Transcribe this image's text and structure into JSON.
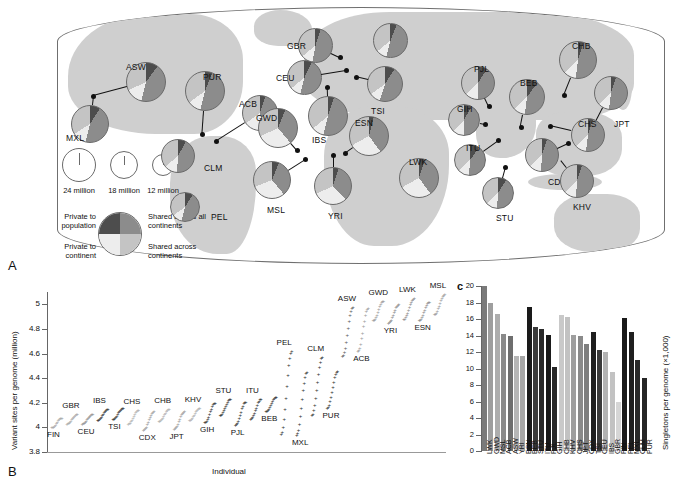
{
  "figure": {
    "panel_a_letter": "A",
    "panel_b_letter": "B",
    "panel_c_letter": "c"
  },
  "map": {
    "size_legend": {
      "items": [
        {
          "label": "24 million",
          "diameter_px": 34
        },
        {
          "label": "18 million",
          "diameter_px": 28
        },
        {
          "label": "12 million",
          "diameter_px": 22
        }
      ]
    },
    "category_legend": {
      "top_left": "Private to population",
      "top_right": "Shared across all continents",
      "bottom_left": "Private to continent",
      "bottom_right": "Shared across continents",
      "colors": {
        "private_to_population": "#4d4d4d",
        "shared_all_continents": "#8c8c8c",
        "private_to_continent": "#ededed",
        "shared_across_continents": "#c4c4c4"
      }
    },
    "populations": [
      {
        "code": "ASW",
        "x": 146,
        "y": 82,
        "d": 40,
        "label_x": 126,
        "label_y": 62,
        "dot_x": 93,
        "dot_y": 96,
        "slices": [
          10,
          44,
          14,
          32
        ]
      },
      {
        "code": "MXL",
        "x": 90,
        "y": 124,
        "d": 38,
        "label_x": 66,
        "label_y": 133,
        "dot_x": 93,
        "dot_y": 96,
        "slices": [
          9,
          45,
          12,
          34
        ]
      },
      {
        "code": "PUR",
        "x": 205,
        "y": 91,
        "d": 40,
        "label_x": 203,
        "label_y": 72,
        "dot_x": 202,
        "dot_y": 134,
        "slices": [
          6,
          48,
          11,
          35
        ]
      },
      {
        "code": "ACB",
        "x": 260,
        "y": 113,
        "d": 36,
        "label_x": 239,
        "label_y": 99,
        "dot_x": 216,
        "dot_y": 141,
        "slices": [
          5,
          41,
          19,
          35
        ]
      },
      {
        "code": "CLM",
        "x": 178,
        "y": 156,
        "d": 34,
        "label_x": 204,
        "label_y": 163,
        "dot_x": 178,
        "dot_y": 156,
        "slices": [
          8,
          43,
          13,
          36
        ]
      },
      {
        "code": "PEL",
        "x": 185,
        "y": 207,
        "d": 30,
        "label_x": 211,
        "label_y": 212,
        "dot_x": 185,
        "dot_y": 207,
        "slices": [
          9,
          45,
          11,
          35
        ]
      },
      {
        "code": "GBR",
        "x": 315,
        "y": 45,
        "d": 35,
        "label_x": 287,
        "label_y": 41,
        "dot_x": 340,
        "dot_y": 57,
        "slices": [
          5,
          48,
          11,
          36
        ]
      },
      {
        "code": "CEU",
        "x": 304,
        "y": 77,
        "d": 35,
        "label_x": 276,
        "label_y": 73,
        "dot_x": 346,
        "dot_y": 70,
        "slices": [
          7,
          47,
          10,
          36
        ]
      },
      {
        "code": "FIN",
        "x": 390,
        "y": 40,
        "d": 35,
        "label_x": 383,
        "label_y": 75,
        "dot_x": 390,
        "dot_y": 40,
        "slices": [
          6,
          48,
          10,
          36
        ]
      },
      {
        "code": "TSI",
        "x": 385,
        "y": 84,
        "d": 36,
        "label_x": 371,
        "label_y": 106,
        "dot_x": 356,
        "dot_y": 77,
        "slices": [
          9,
          46,
          10,
          35
        ]
      },
      {
        "code": "IBS",
        "x": 328,
        "y": 116,
        "d": 40,
        "label_x": 312,
        "label_y": 135,
        "dot_x": 327,
        "dot_y": 87,
        "slices": [
          5,
          49,
          10,
          36
        ]
      },
      {
        "code": "GWD",
        "x": 278,
        "y": 128,
        "d": 40,
        "label_x": 256,
        "label_y": 113,
        "dot_x": 297,
        "dot_y": 150,
        "slices": [
          6,
          33,
          29,
          32
        ]
      },
      {
        "code": "MSL",
        "x": 272,
        "y": 180,
        "d": 38,
        "label_x": 267,
        "label_y": 205,
        "dot_x": 305,
        "dot_y": 159,
        "slices": [
          6,
          33,
          30,
          31
        ]
      },
      {
        "code": "YRI",
        "x": 333,
        "y": 186,
        "d": 38,
        "label_x": 328,
        "label_y": 211,
        "dot_x": 333,
        "dot_y": 155,
        "slices": [
          5,
          33,
          30,
          32
        ]
      },
      {
        "code": "ESN",
        "x": 369,
        "y": 136,
        "d": 40,
        "label_x": 355,
        "label_y": 118,
        "dot_x": 345,
        "dot_y": 153,
        "slices": [
          4,
          36,
          27,
          33
        ]
      },
      {
        "code": "LWK",
        "x": 419,
        "y": 178,
        "d": 40,
        "label_x": 409,
        "label_y": 157,
        "dot_x": 419,
        "dot_y": 178,
        "slices": [
          5,
          35,
          27,
          33
        ]
      },
      {
        "code": "PJL",
        "x": 478,
        "y": 83,
        "d": 34,
        "label_x": 474,
        "label_y": 64,
        "dot_x": 489,
        "dot_y": 106,
        "slices": [
          9,
          41,
          13,
          37
        ]
      },
      {
        "code": "GIH",
        "x": 464,
        "y": 120,
        "d": 32,
        "label_x": 457,
        "label_y": 104,
        "dot_x": 485,
        "dot_y": 124,
        "slices": [
          8,
          42,
          12,
          38
        ]
      },
      {
        "code": "BEB",
        "x": 527,
        "y": 97,
        "d": 36,
        "label_x": 520,
        "label_y": 78,
        "dot_x": 521,
        "dot_y": 127,
        "slices": [
          10,
          42,
          11,
          37
        ]
      },
      {
        "code": "ITU",
        "x": 470,
        "y": 160,
        "d": 32,
        "label_x": 466,
        "label_y": 143,
        "dot_x": 498,
        "dot_y": 140,
        "slices": [
          10,
          41,
          12,
          37
        ]
      },
      {
        "code": "STU",
        "x": 498,
        "y": 193,
        "d": 32,
        "label_x": 496,
        "label_y": 213,
        "dot_x": 505,
        "dot_y": 167,
        "slices": [
          9,
          42,
          12,
          37
        ]
      },
      {
        "code": "CHB",
        "x": 578,
        "y": 60,
        "d": 38,
        "label_x": 572,
        "label_y": 41,
        "dot_x": 564,
        "dot_y": 95,
        "slices": [
          5,
          47,
          11,
          37
        ]
      },
      {
        "code": "JPT",
        "x": 611,
        "y": 93,
        "d": 34,
        "label_x": 614,
        "label_y": 119,
        "dot_x": 593,
        "dot_y": 128,
        "slices": [
          5,
          47,
          11,
          37
        ]
      },
      {
        "code": "CHS",
        "x": 588,
        "y": 135,
        "d": 34,
        "label_x": 578,
        "label_y": 119,
        "dot_x": 550,
        "dot_y": 126,
        "slices": [
          5,
          47,
          11,
          37
        ]
      },
      {
        "code": "CDX",
        "x": 542,
        "y": 155,
        "d": 34,
        "label_x": 548,
        "label_y": 177,
        "dot_x": 568,
        "dot_y": 143,
        "slices": [
          5,
          46,
          12,
          37
        ]
      },
      {
        "code": "KHV",
        "x": 577,
        "y": 181,
        "d": 34,
        "label_x": 573,
        "label_y": 202,
        "dot_x": 561,
        "dot_y": 161,
        "slices": [
          5,
          46,
          12,
          37
        ]
      }
    ]
  },
  "chart_data": [
    {
      "id": "panel_b",
      "type": "scatter",
      "title": "",
      "xlabel": "Individual",
      "ylabel": "Variant sites per genome (million)",
      "ylim": [
        3.8,
        5.1
      ],
      "yticks": [
        "3.8",
        "4",
        "4.2",
        "4.4",
        "4.6",
        "4.8",
        "5"
      ],
      "grid": false,
      "legend": "none",
      "groups": [
        {
          "name": "FIN",
          "median": 4.04,
          "low": 4.0,
          "high": 4.08,
          "shade": "#a8a8a8",
          "label_pos": "below"
        },
        {
          "name": "GBR",
          "median": 4.07,
          "low": 4.03,
          "high": 4.11,
          "shade": "#a8a8a8",
          "label_pos": "above"
        },
        {
          "name": "CEU",
          "median": 4.07,
          "low": 4.03,
          "high": 4.11,
          "shade": "#8f8f8f",
          "label_pos": "below"
        },
        {
          "name": "IBS",
          "median": 4.11,
          "low": 4.06,
          "high": 4.15,
          "shade": "#2f2f2f",
          "label_pos": "above"
        },
        {
          "name": "TSI",
          "median": 4.12,
          "low": 4.07,
          "high": 4.16,
          "shade": "#2f2f2f",
          "label_pos": "below"
        },
        {
          "name": "CHS",
          "median": 4.09,
          "low": 4.03,
          "high": 4.14,
          "shade": "#b0b0b0",
          "label_pos": "above"
        },
        {
          "name": "CDX",
          "median": 4.08,
          "low": 3.98,
          "high": 4.13,
          "shade": "#9a9a9a",
          "label_pos": "below"
        },
        {
          "name": "CHB",
          "median": 4.1,
          "low": 4.05,
          "high": 4.15,
          "shade": "#b0b0b0",
          "label_pos": "above"
        },
        {
          "name": "JPT",
          "median": 4.08,
          "low": 3.99,
          "high": 4.13,
          "shade": "#9a9a9a",
          "label_pos": "below"
        },
        {
          "name": "KHV",
          "median": 4.11,
          "low": 4.06,
          "high": 4.16,
          "shade": "#b0b0b0",
          "label_pos": "above"
        },
        {
          "name": "GIH",
          "median": 4.14,
          "low": 4.04,
          "high": 4.2,
          "shade": "#2f2f2f",
          "label_pos": "below"
        },
        {
          "name": "STU",
          "median": 4.17,
          "low": 4.1,
          "high": 4.23,
          "shade": "#2f2f2f",
          "label_pos": "above"
        },
        {
          "name": "PJL",
          "median": 4.14,
          "low": 4.02,
          "high": 4.21,
          "shade": "#2f2f2f",
          "label_pos": "below"
        },
        {
          "name": "ITU",
          "median": 4.17,
          "low": 4.07,
          "high": 4.23,
          "shade": "#2f2f2f",
          "label_pos": "above"
        },
        {
          "name": "BEB",
          "median": 4.19,
          "low": 4.13,
          "high": 4.25,
          "shade": "#2f2f2f",
          "label_pos": "below"
        },
        {
          "name": "PEL",
          "median": 4.13,
          "low": 3.95,
          "high": 4.62,
          "shade": "#2f2f2f",
          "label_pos": "above"
        },
        {
          "name": "MXL",
          "median": 4.16,
          "low": 3.94,
          "high": 4.45,
          "shade": "#2f2f2f",
          "label_pos": "below"
        },
        {
          "name": "CLM",
          "median": 4.27,
          "low": 4.1,
          "high": 4.57,
          "shade": "#2f2f2f",
          "label_pos": "above"
        },
        {
          "name": "PUR",
          "median": 4.3,
          "low": 4.16,
          "high": 4.46,
          "shade": "#2f2f2f",
          "label_pos": "below"
        },
        {
          "name": "ASW",
          "median": 4.85,
          "low": 4.58,
          "high": 4.98,
          "shade": "#5a5a5a",
          "label_pos": "above"
        },
        {
          "name": "ACB",
          "median": 4.87,
          "low": 4.62,
          "high": 4.97,
          "shade": "#9a9a9a",
          "label_pos": "below"
        },
        {
          "name": "GWD",
          "median": 4.95,
          "low": 4.87,
          "high": 5.03,
          "shade": "#9a9a9a",
          "label_pos": "above"
        },
        {
          "name": "YRI",
          "median": 4.93,
          "low": 4.85,
          "high": 5.0,
          "shade": "#8a8a8a",
          "label_pos": "below"
        },
        {
          "name": "LWK",
          "median": 4.97,
          "low": 4.88,
          "high": 5.05,
          "shade": "#8a8a8a",
          "label_pos": "above"
        },
        {
          "name": "ESN",
          "median": 4.95,
          "low": 4.87,
          "high": 5.02,
          "shade": "#8a8a8a",
          "label_pos": "below"
        },
        {
          "name": "MSL",
          "median": 5.0,
          "low": 4.92,
          "high": 5.08,
          "shade": "#9a9a9a",
          "label_pos": "above"
        }
      ]
    },
    {
      "id": "panel_c",
      "type": "bar",
      "title": "",
      "xlabel": "",
      "ylabel": "Singletons per genome (×1,000)",
      "ylim": [
        0,
        20
      ],
      "yticks": [
        "0",
        "2",
        "4",
        "6",
        "8",
        "10",
        "12",
        "14",
        "16",
        "18",
        "20"
      ],
      "grid": false,
      "legend": "none",
      "categories": [
        "LWK",
        "GWD",
        "MSL",
        "ACB",
        "ASW",
        "YRI",
        "ESN",
        "BEB",
        "STU",
        "ITU",
        "PJL",
        "GIH",
        "CHB",
        "KHV",
        "CHS",
        "JPT",
        "CDX",
        "TSI",
        "CEU",
        "IBS",
        "GBR",
        "FIN",
        "PEL",
        "MXL",
        "CLM",
        "PUR"
      ],
      "values": [
        20.4,
        17.9,
        16.6,
        14.2,
        13.9,
        11.5,
        11.5,
        17.4,
        15.0,
        14.8,
        14.1,
        10.2,
        16.5,
        16.3,
        14.1,
        13.9,
        13.0,
        14.4,
        12.2,
        12.0,
        9.6,
        5.9,
        16.1,
        14.4,
        11.0,
        8.9
      ],
      "bar_colors": [
        "#7a7a7a",
        "#9e9e9e",
        "#adadad",
        "#8a8a8a",
        "#6e6e6e",
        "#b6b6b6",
        "#a6a6a6",
        "#1a1a1a",
        "#3a3a3a",
        "#2a2a2a",
        "#1a1a1a",
        "#262626",
        "#c9c9c9",
        "#c2c2c2",
        "#9e9e9e",
        "#8a8a8a",
        "#7e7e7e",
        "#1f1f1f",
        "#3a3a3a",
        "#b2b2b2",
        "#c2c2c2",
        "#d6d6d6",
        "#1a1a1a",
        "#1f1f1f",
        "#2a2a2a",
        "#262626"
      ]
    }
  ]
}
